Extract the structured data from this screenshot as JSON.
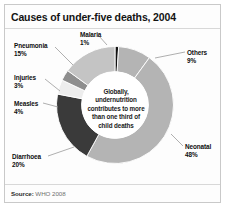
{
  "figure": {
    "title": "Causes of under-five deaths, 2004",
    "source_label": "Source:",
    "source_value": "WHO 2008"
  },
  "center_note": {
    "line1": "Globally,",
    "line2": "undernutrition",
    "line3": "contributes to more",
    "line4": "than one third of",
    "line5": "child deaths",
    "full": "Globally, undernutrition contributes to more than one third of child deaths"
  },
  "labels": {
    "malaria": {
      "name": "Malaria",
      "pct": "1%"
    },
    "others": {
      "name": "Others",
      "pct": "9%"
    },
    "neonatal": {
      "name": "Neonatal",
      "pct": "48%"
    },
    "diarrhoea": {
      "name": "Diarrhoea",
      "pct": "20%"
    },
    "measles": {
      "name": "Measles",
      "pct": "4%"
    },
    "injuries": {
      "name": "Injuries",
      "pct": "3%"
    },
    "pneumonia": {
      "name": "Pneumonia",
      "pct": "15%"
    }
  },
  "chart_data": {
    "type": "pie",
    "variant": "donut",
    "title": "Causes of under-five deaths, 2004",
    "xlabel": "",
    "ylabel": "",
    "units": "percent of under-five deaths",
    "total": 100,
    "start_angle_deg": 0,
    "direction": "clockwise",
    "inner_radius_ratio": 0.57,
    "legend": "none-callout-labels",
    "grid": false,
    "categories": [
      "Malaria",
      "Others",
      "Neonatal",
      "Diarrhoea",
      "Measles",
      "Injuries",
      "Pneumonia"
    ],
    "values": [
      1,
      9,
      48,
      20,
      4,
      3,
      15
    ],
    "slices": [
      {
        "label": "Malaria",
        "value": 1,
        "pct": "1%",
        "color": "#121212"
      },
      {
        "label": "Others",
        "value": 9,
        "pct": "9%",
        "color": "#b4b4b4"
      },
      {
        "label": "Neonatal",
        "value": 48,
        "pct": "48%",
        "color": "#b4b4b4"
      },
      {
        "label": "Diarrhoea",
        "value": 20,
        "pct": "20%",
        "color": "#3a3a3a"
      },
      {
        "label": "Measles",
        "value": 4,
        "pct": "4%",
        "color": "#ededed"
      },
      {
        "label": "Injuries",
        "value": 3,
        "pct": "3%",
        "color": "#8e8e8e"
      },
      {
        "label": "Pneumonia",
        "value": 15,
        "pct": "15%",
        "color": "#c4c4c4"
      }
    ],
    "annotations": [
      "Globally, undernutrition contributes to more than one third of child deaths"
    ],
    "source": "Source: WHO 2008"
  },
  "colors": {
    "black": "#121212",
    "dark_gray": "#3a3a3a",
    "mid_gray": "#8e8e8e",
    "light_gray": "#b4b4b4",
    "lighter_gray": "#c4c4c4",
    "near_white": "#ededed",
    "background": "#fdfdfd",
    "border": "#c9c9c9",
    "text": "#131313"
  }
}
